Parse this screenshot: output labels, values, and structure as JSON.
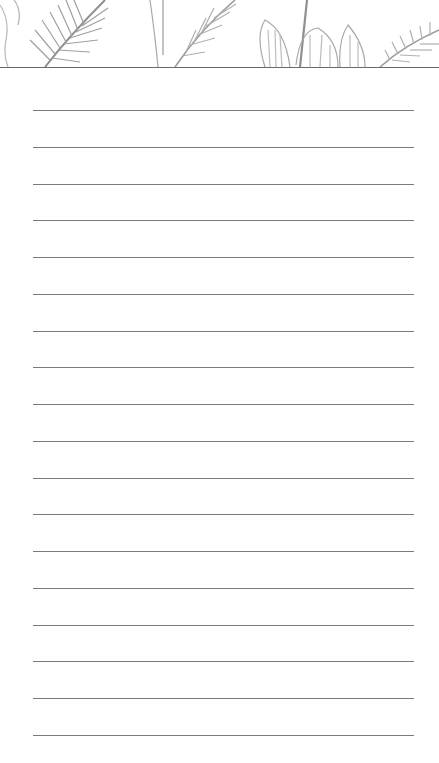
{
  "page": {
    "type": "lined-notepad",
    "header_decoration": "tropical-leaves-illustration",
    "line_count": 18,
    "first_line_y": 110,
    "line_spacing": 36.75,
    "line_left": 33,
    "line_width": 381,
    "colors": {
      "background": "#ffffff",
      "line": "#7a7a7a",
      "leaf": "#9a9a9a",
      "header_border": "#6a6a6a"
    }
  }
}
